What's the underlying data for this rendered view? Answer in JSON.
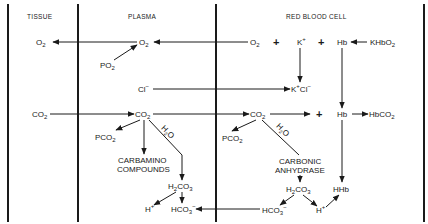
{
  "headers": {
    "tissue": "TISSUE",
    "plasma": "PLASMA",
    "rbc": "RED BLOOD CELL"
  },
  "tissue": {
    "o2": "O",
    "o2_sub": "2",
    "co2": "CO",
    "co2_sub": "2"
  },
  "plasma": {
    "o2": "O",
    "o2_sub": "2",
    "po2": "PO",
    "po2_sub": "2",
    "cl": "Cl",
    "cl_sup": "−",
    "co2": "CO",
    "co2_sub": "2",
    "pco2": "PCO",
    "pco2_sub": "2",
    "h2o_a": "H",
    "h2o_sub": "2",
    "h2o_b": "O",
    "carbamino_1": "CARBAMINO",
    "carbamino_2": "COMPOUNDS",
    "h2co3_a": "H",
    "h2co3_sub1": "2",
    "h2co3_b": "CO",
    "h2co3_sub2": "3",
    "h": "H",
    "h_sup": "+",
    "hco3": "HCO",
    "hco3_sub": "3",
    "hco3_sup": "−"
  },
  "rbc": {
    "o2": "O",
    "o2_sub": "2",
    "plus1": "+",
    "k": "K",
    "k_sup": "+",
    "plus2": "+",
    "hb_top": "Hb",
    "khbo2_a": "KHbO",
    "khbo2_sub": "2",
    "kcl_a": "K",
    "kcl_sup1": "+",
    "kcl_b": "Cl",
    "kcl_sup2": "−",
    "co2": "CO",
    "co2_sub": "2",
    "plus3": "+",
    "hb_mid": "Hb",
    "hbco2_a": "HbCO",
    "hbco2_sub": "2",
    "pco2": "PCO",
    "pco2_sub": "2",
    "h2o_a": "H",
    "h2o_sub": "2",
    "h2o_b": "O",
    "carbonic_1": "CARBONIC",
    "carbonic_2": "ANHYDRASE",
    "h2co3_a": "H",
    "h2co3_sub1": "2",
    "h2co3_b": "CO",
    "h2co3_sub2": "3",
    "hhb": "HHb",
    "hco3": "HCO",
    "hco3_sub": "3",
    "hco3_sup": "−",
    "h": "H",
    "h_sup": "+"
  }
}
